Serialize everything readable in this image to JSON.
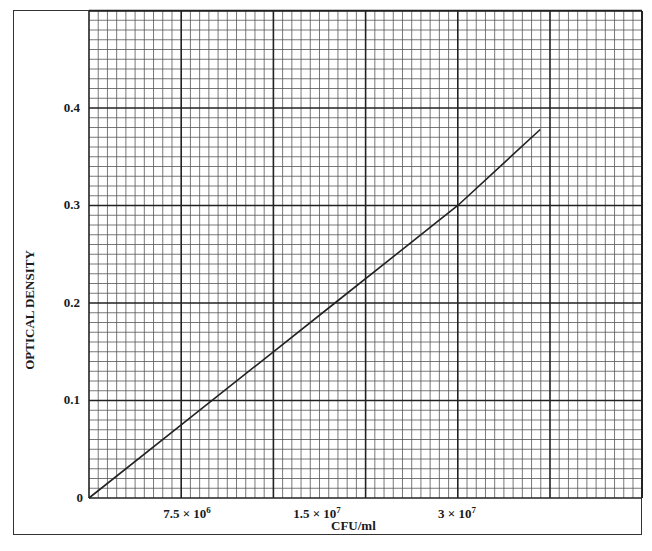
{
  "chart_data": {
    "type": "line",
    "title": "",
    "xlabel": "CFU/ml",
    "ylabel": "OPTICAL DENSITY",
    "x_tick_labels": [
      {
        "value": 7500000,
        "label": "7.5 × 10",
        "exp": "6"
      },
      {
        "value": 15000000,
        "label": "1.5 × 10",
        "exp": "7"
      },
      {
        "value": 30000000,
        "label": "3 × 10",
        "exp": "7"
      }
    ],
    "y_tick_labels": [
      "0",
      "0.1",
      "0.2",
      "0.3",
      "0.4"
    ],
    "xlim": [
      0,
      45000000
    ],
    "ylim": [
      0,
      0.5
    ],
    "grid": true,
    "grid_style": "graph paper, 10 minor lines per major division",
    "series": [
      {
        "name": "Standard curve",
        "x": [
          0,
          7500000,
          15000000,
          20000000,
          30000000,
          36700000
        ],
        "y": [
          0,
          0.075,
          0.15,
          0.2,
          0.3,
          0.378
        ]
      }
    ]
  },
  "labels": {
    "y_title": "OPTICAL DENSITY",
    "x_title": "CFU/ml",
    "y_ticks": [
      "0",
      "0.1",
      "0.2",
      "0.3",
      "0.4"
    ],
    "x_ticks": [
      {
        "base": "7.5 × 10",
        "exp": "6"
      },
      {
        "base": "1.5 × 10",
        "exp": "7"
      },
      {
        "base": "3 × 10",
        "exp": "7"
      }
    ]
  },
  "colors": {
    "grid_minor": "#555555",
    "grid_major": "#222222",
    "line": "#222222",
    "background": "#ffffff"
  }
}
